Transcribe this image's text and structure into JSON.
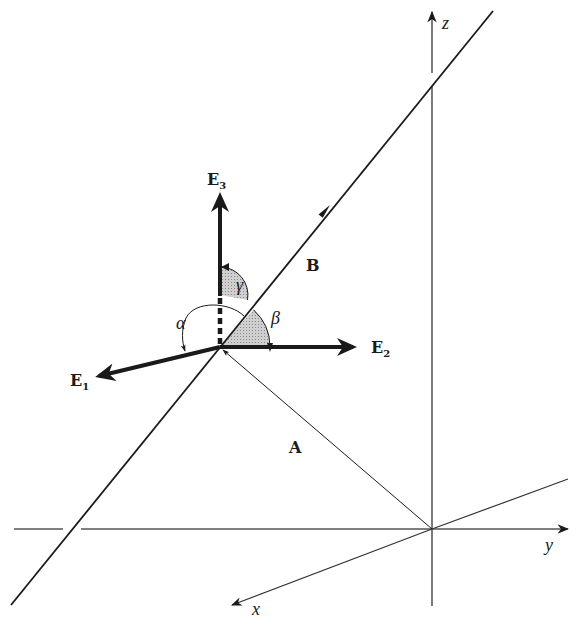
{
  "diagram": {
    "type": "3d-coordinate-diagram",
    "axes": {
      "x": {
        "label": "x"
      },
      "y": {
        "label": "y"
      },
      "z": {
        "label": "z"
      }
    },
    "vectors": {
      "A": {
        "label": "A",
        "description": "position vector from origin to point on line"
      },
      "B": {
        "label": "B",
        "description": "direction of line"
      }
    },
    "frame": {
      "E1": {
        "label": "E",
        "subscript": "1"
      },
      "E2": {
        "label": "E",
        "subscript": "2"
      },
      "E3": {
        "label": "E",
        "subscript": "3"
      }
    },
    "angles": {
      "alpha": {
        "label": "α",
        "between": [
          "B",
          "E1"
        ]
      },
      "beta": {
        "label": "β",
        "between": [
          "B",
          "E2"
        ]
      },
      "gamma": {
        "label": "γ",
        "between": [
          "B",
          "E3"
        ]
      }
    },
    "colors": {
      "ink": "#1a1a1a",
      "axis": "#333333",
      "shade": "#bdbdbd"
    }
  }
}
